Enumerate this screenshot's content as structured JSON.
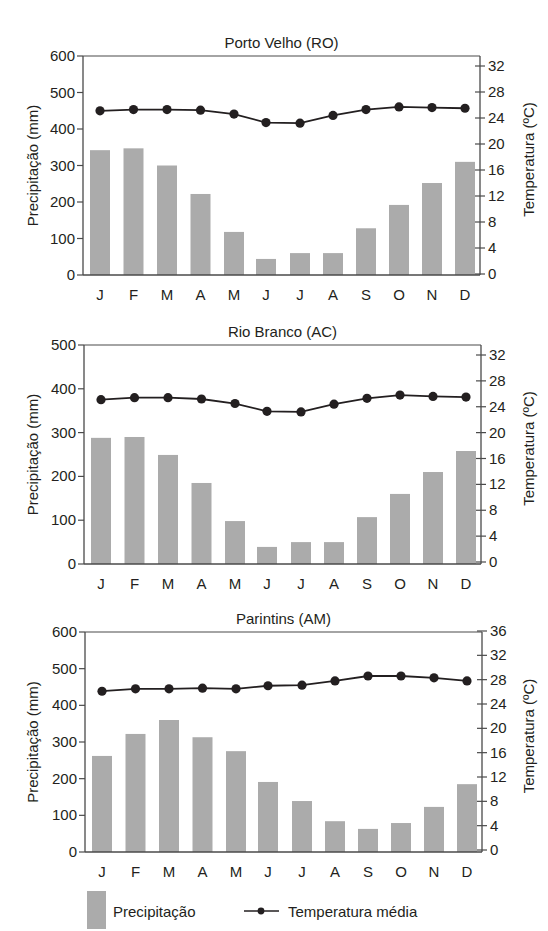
{
  "legend": {
    "precip_label": "Precipitação",
    "temp_label": "Temperatura média"
  },
  "colors": {
    "bar": "#ababab",
    "line": "#231f20",
    "axis": "#4a4a4a"
  },
  "chart_data": [
    {
      "type": "bar+line",
      "title": "Porto Velho (RO)",
      "categories": [
        "J",
        "F",
        "M",
        "A",
        "M",
        "J",
        "J",
        "A",
        "S",
        "O",
        "N",
        "D"
      ],
      "xlabel": "",
      "ylabel": "Precipitação (mm)",
      "y2label": "Temperatura (ºC)",
      "ylim": [
        0,
        600
      ],
      "yticks": [
        0,
        100,
        200,
        300,
        400,
        500,
        600
      ],
      "y2lim": [
        0,
        33.5
      ],
      "y2ticks": [
        0,
        4,
        8,
        12,
        16,
        20,
        24,
        28,
        32
      ],
      "series": [
        {
          "name": "Precipitação",
          "type": "bar",
          "axis": "left",
          "values": [
            342,
            347,
            300,
            222,
            118,
            44,
            60,
            60,
            128,
            192,
            252,
            310
          ]
        },
        {
          "name": "Temperatura média",
          "type": "line",
          "axis": "right",
          "values": [
            25.1,
            25.3,
            25.3,
            25.2,
            24.6,
            23.3,
            23.2,
            24.4,
            25.3,
            25.7,
            25.6,
            25.5
          ]
        }
      ],
      "grid": false,
      "legend_position": "bottom"
    },
    {
      "type": "bar+line",
      "title": "Rio Branco (AC)",
      "categories": [
        "J",
        "F",
        "M",
        "A",
        "M",
        "J",
        "J",
        "A",
        "S",
        "O",
        "N",
        "D"
      ],
      "xlabel": "",
      "ylabel": "Precipitação (mm)",
      "y2label": "Temperatura (ºC)",
      "ylim": [
        0,
        500
      ],
      "yticks": [
        0,
        100,
        200,
        300,
        400,
        500
      ],
      "y2lim": [
        0,
        33.5
      ],
      "y2ticks": [
        0,
        4,
        8,
        12,
        16,
        20,
        24,
        28,
        32
      ],
      "series": [
        {
          "name": "Precipitação",
          "type": "bar",
          "axis": "left",
          "values": [
            288,
            290,
            249,
            185,
            98,
            39,
            50,
            50,
            107,
            160,
            210,
            258
          ]
        },
        {
          "name": "Temperatura média",
          "type": "line",
          "axis": "right",
          "values": [
            25.1,
            25.4,
            25.4,
            25.2,
            24.5,
            23.3,
            23.2,
            24.4,
            25.3,
            25.8,
            25.6,
            25.5
          ]
        }
      ],
      "grid": false,
      "legend_position": "bottom"
    },
    {
      "type": "bar+line",
      "title": "Parintins (AM)",
      "categories": [
        "J",
        "F",
        "M",
        "A",
        "M",
        "J",
        "J",
        "A",
        "S",
        "O",
        "N",
        "D"
      ],
      "xlabel": "",
      "ylabel": "Precipitação (mm)",
      "y2label": "Temperatura (ºC)",
      "ylim": [
        0,
        600
      ],
      "yticks": [
        0,
        100,
        200,
        300,
        400,
        500,
        600
      ],
      "y2lim": [
        0,
        36
      ],
      "y2ticks": [
        0,
        4,
        8,
        12,
        16,
        20,
        24,
        28,
        32,
        36
      ],
      "series": [
        {
          "name": "Precipitação",
          "type": "bar",
          "axis": "left",
          "values": [
            262,
            322,
            360,
            313,
            275,
            191,
            139,
            84,
            63,
            79,
            123,
            185
          ]
        },
        {
          "name": "Temperatura média",
          "type": "line",
          "axis": "right",
          "values": [
            26.1,
            26.5,
            26.5,
            26.6,
            26.5,
            27.0,
            27.1,
            27.8,
            28.6,
            28.6,
            28.3,
            27.8
          ]
        }
      ],
      "grid": false,
      "legend_position": "bottom"
    }
  ]
}
